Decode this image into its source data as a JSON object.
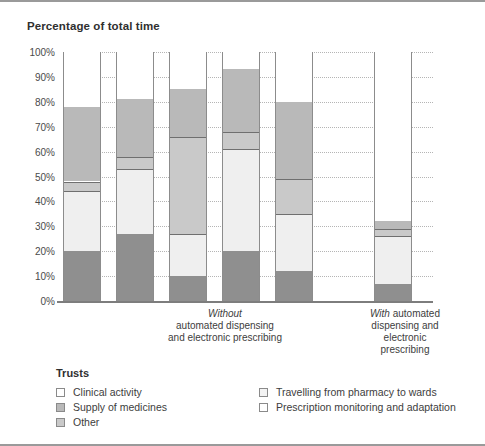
{
  "chart_title": "Percentage of total time",
  "axis": {
    "y_ticks": [
      "100%",
      "90%",
      "80%",
      "70%",
      "60%",
      "50%",
      "40%",
      "30%",
      "20%",
      "10%",
      "0%"
    ]
  },
  "groups": {
    "without_line1": "Without",
    "without_line2": "automated dispensing",
    "without_line3": "and electronic prescribing",
    "with_line1": "With",
    "with_line1b": " automated",
    "with_line2": "dispensing and",
    "with_line3": "electronic",
    "with_line4": "prescribing"
  },
  "legend": {
    "title": "Trusts",
    "items": [
      {
        "label": "Clinical activity",
        "key": "clinical",
        "color": "#ffffff"
      },
      {
        "label": "Supply of medicines",
        "key": "supply",
        "color": "#b9b9b9"
      },
      {
        "label": "Other",
        "key": "other",
        "color": "#c9c9c9"
      },
      {
        "label": "Travelling from pharmacy to wards",
        "key": "travel",
        "color": "#f3f3f3"
      },
      {
        "label": "Prescription monitoring and adaptation",
        "key": "prescription",
        "color": "#8f8f8f"
      }
    ]
  },
  "chart_data": {
    "type": "bar",
    "subtype": "stacked-100-percent",
    "title": "Percentage of total time",
    "xlabel": "Trusts",
    "ylabel": "Percentage of total time",
    "ylim": [
      0,
      100
    ],
    "ytick_step": 10,
    "grid": true,
    "legend_position": "bottom",
    "categories": [
      "Trust 1",
      "Trust 2",
      "Trust 3",
      "Trust 4",
      "Trust 5",
      "Trust 6"
    ],
    "group_labels": {
      "Trust 1": "Without automated dispensing and electronic prescribing",
      "Trust 2": "Without automated dispensing and electronic prescribing",
      "Trust 3": "Without automated dispensing and electronic prescribing",
      "Trust 4": "Without automated dispensing and electronic prescribing",
      "Trust 5": "Without automated dispensing and electronic prescribing",
      "Trust 6": "With automated dispensing and electronic prescribing"
    },
    "series": [
      {
        "name": "Prescription monitoring and adaptation",
        "key": "prescription",
        "color": "#8f8f8f",
        "values": [
          20,
          27,
          10,
          20,
          12,
          7
        ]
      },
      {
        "name": "Travelling from pharmacy to wards",
        "key": "travel",
        "color": "#f3f3f3",
        "values": [
          24,
          26,
          17,
          41,
          23,
          19
        ]
      },
      {
        "name": "Other",
        "key": "other",
        "color": "#c9c9c9",
        "values": [
          4,
          5,
          39,
          7,
          14,
          3
        ]
      },
      {
        "name": "Supply of medicines",
        "key": "supply",
        "color": "#b9b9b9",
        "values": [
          30,
          23,
          19,
          25,
          31,
          3
        ]
      },
      {
        "name": "Clinical activity",
        "key": "clinical",
        "color": "#ffffff",
        "values": [
          22,
          19,
          15,
          7,
          20,
          68
        ]
      }
    ],
    "stack_order_bottom_to_top": [
      "prescription",
      "travel",
      "other",
      "supply",
      "clinical"
    ],
    "cumulative_tops": {
      "Trust 1": {
        "prescription": 20,
        "travel": 44,
        "other": 48,
        "supply": 78,
        "clinical": 100
      },
      "Trust 2": {
        "prescription": 27,
        "travel": 53,
        "other": 58,
        "supply": 81,
        "clinical": 100
      },
      "Trust 3": {
        "prescription": 10,
        "travel": 27,
        "other": 66,
        "supply": 85,
        "clinical": 100
      },
      "Trust 4": {
        "prescription": 20,
        "travel": 61,
        "other": 68,
        "supply": 93,
        "clinical": 100
      },
      "Trust 5": {
        "prescription": 12,
        "travel": 35,
        "other": 49,
        "supply": 80,
        "clinical": 100
      },
      "Trust 6": {
        "prescription": 7,
        "travel": 26,
        "other": 29,
        "supply": 32,
        "clinical": 100
      }
    }
  }
}
